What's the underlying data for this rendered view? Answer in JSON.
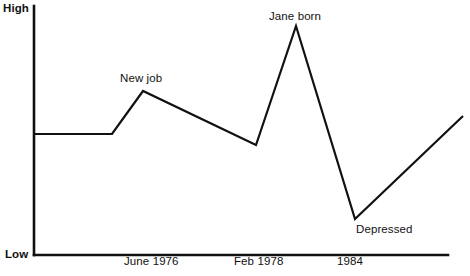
{
  "chart_data": {
    "type": "line",
    "title": "",
    "subtitle": "",
    "xlabel": "",
    "ylabel": "",
    "grid": false,
    "legend": null,
    "axis_labels": {
      "y_top": "High",
      "y_bottom": "Low"
    },
    "x_tick_labels": [
      "June 1976",
      "Feb 1978",
      "1984"
    ],
    "x_tick_positions_px": [
      150,
      256,
      348
    ],
    "ylim": [
      "Low",
      "High"
    ],
    "annotations": [
      {
        "text": "New job",
        "x_px": 143,
        "y_px": 91
      },
      {
        "text": "Jane born",
        "x_px": 296,
        "y_px": 26
      },
      {
        "text": "Depressed",
        "x_px": 355,
        "y_px": 219
      }
    ],
    "series": [
      {
        "name": "mood",
        "points": [
          {
            "x_px": 34,
            "y_px": 134,
            "label": "start",
            "level": "medium"
          },
          {
            "x_px": 112,
            "y_px": 134,
            "label": "",
            "level": "medium"
          },
          {
            "x_px": 143,
            "y_px": 91,
            "label": "New job",
            "level": "high"
          },
          {
            "x_px": 256,
            "y_px": 145,
            "label": "Feb 1978",
            "level": "medium-low"
          },
          {
            "x_px": 296,
            "y_px": 26,
            "label": "Jane born",
            "level": "very-high"
          },
          {
            "x_px": 355,
            "y_px": 219,
            "label": "Depressed",
            "level": "very-low"
          },
          {
            "x_px": 463,
            "y_px": 116,
            "label": "end",
            "level": "medium-high"
          }
        ]
      }
    ],
    "axes_geometry": {
      "y_axis_x_px": 34,
      "y_axis_top_px": 6,
      "y_axis_bottom_px": 255,
      "x_axis_left_px": 34,
      "x_axis_right_px": 448,
      "x_axis_y_px": 255
    },
    "colors": {
      "line": "#111111",
      "axis": "#111111",
      "background": "#ffffff",
      "text": "#111111"
    }
  }
}
